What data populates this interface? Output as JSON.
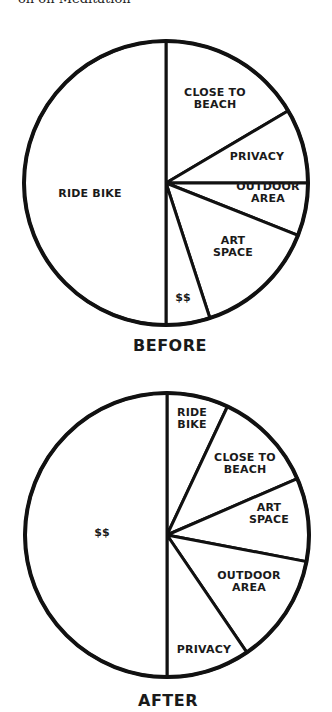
{
  "caption_top": "on on Meditation",
  "chart_data": [
    {
      "type": "pie",
      "title": "BEFORE",
      "start_angle": "top, clockwise",
      "categories": [
        "CLOSE TO BEACH",
        "PRIVACY",
        "OUTDOOR AREA",
        "ART SPACE",
        "$$",
        "RIDE BIKE"
      ],
      "values": [
        16.5,
        8.5,
        6,
        14,
        5,
        50
      ],
      "labels": [
        [
          "CLOSE TO",
          "BEACH"
        ],
        [
          "PRIVACY"
        ],
        [
          "OUTDOOR",
          "AREA"
        ],
        [
          "ART",
          "SPACE"
        ],
        [
          "$$"
        ],
        [
          "RIDE BIKE"
        ]
      ],
      "center": [
        166,
        183
      ],
      "radius": 142,
      "label_pos": [
        [
          215,
          102
        ],
        [
          257,
          160
        ],
        [
          268,
          196
        ],
        [
          233,
          250
        ],
        [
          183,
          301
        ],
        [
          90,
          197
        ]
      ],
      "title_pos": [
        170,
        351
      ]
    },
    {
      "type": "pie",
      "title": "AFTER",
      "start_angle": "top, clockwise",
      "categories": [
        "RIDE BIKE",
        "CLOSE TO BEACH",
        "ART SPACE",
        "OUTDOOR AREA",
        "PRIVACY",
        "$$"
      ],
      "values": [
        7,
        11.5,
        9.5,
        12.5,
        9.5,
        50
      ],
      "labels": [
        [
          "RIDE",
          "BIKE"
        ],
        [
          "CLOSE TO",
          "BEACH"
        ],
        [
          "ART",
          "SPACE"
        ],
        [
          "OUTDOOR",
          "AREA"
        ],
        [
          "PRIVACY"
        ],
        [
          "$$"
        ]
      ],
      "center": [
        167,
        535
      ],
      "radius": 142,
      "label_pos": [
        [
          192,
          422
        ],
        [
          245,
          467
        ],
        [
          269,
          517
        ],
        [
          249,
          585
        ],
        [
          204,
          653
        ],
        [
          102,
          536
        ]
      ],
      "title_pos": [
        168,
        706
      ]
    }
  ]
}
